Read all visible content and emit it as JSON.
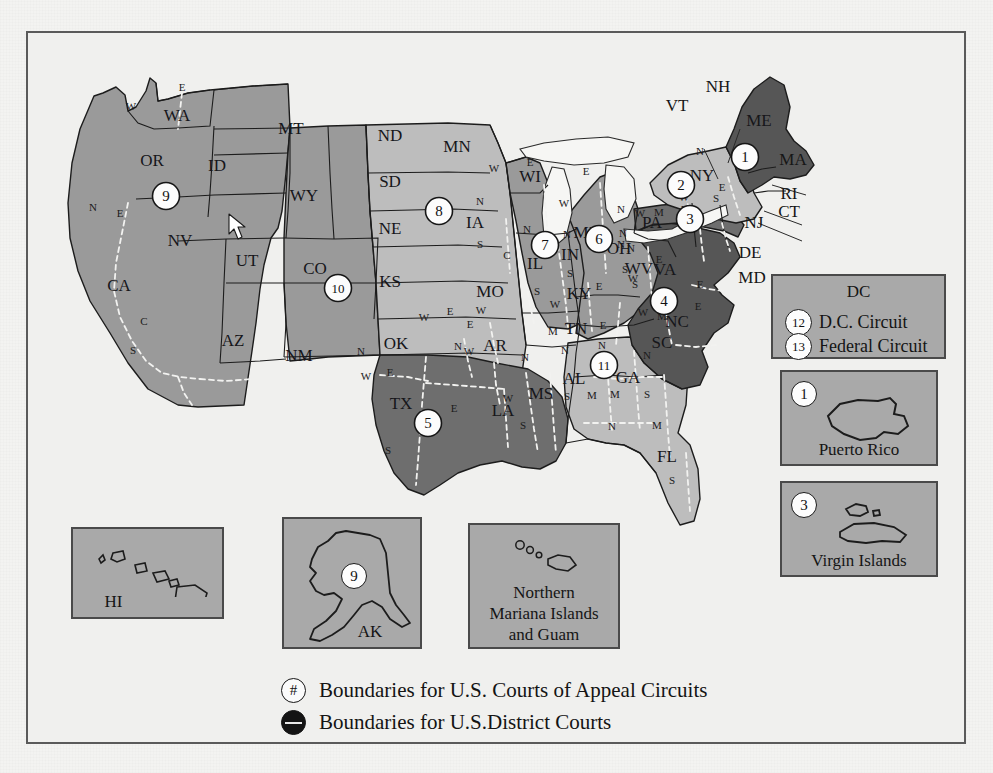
{
  "colors": {
    "page_bg": "#f3f3f1",
    "frame_border": "#5a5a5a",
    "circuit_light": "#bfbfbf",
    "circuit_mid": "#9a9a9a",
    "circuit_dark": "#6e6e6e",
    "circuit_darker": "#565656",
    "water": "#f5f5f3",
    "inset_fill": "#a9a9a9",
    "outline": "#1c1c1c",
    "district_line": "#f0f0f0"
  },
  "states": [
    {
      "code": "WA",
      "x": 175,
      "y": 115
    },
    {
      "code": "OR",
      "x": 150,
      "y": 160
    },
    {
      "code": "CA",
      "x": 117,
      "y": 285
    },
    {
      "code": "NV",
      "x": 178,
      "y": 240
    },
    {
      "code": "ID",
      "x": 215,
      "y": 165
    },
    {
      "code": "UT",
      "x": 245,
      "y": 260
    },
    {
      "code": "AZ",
      "x": 231,
      "y": 340
    },
    {
      "code": "MT",
      "x": 289,
      "y": 128
    },
    {
      "code": "WY",
      "x": 302,
      "y": 195
    },
    {
      "code": "CO",
      "x": 313,
      "y": 268
    },
    {
      "code": "NM",
      "x": 297,
      "y": 355
    },
    {
      "code": "ND",
      "x": 388,
      "y": 135
    },
    {
      "code": "SD",
      "x": 388,
      "y": 181
    },
    {
      "code": "NE",
      "x": 388,
      "y": 228
    },
    {
      "code": "KS",
      "x": 388,
      "y": 281
    },
    {
      "code": "OK",
      "x": 394,
      "y": 343
    },
    {
      "code": "TX",
      "x": 399,
      "y": 403
    },
    {
      "code": "MN",
      "x": 455,
      "y": 146
    },
    {
      "code": "IA",
      "x": 473,
      "y": 222
    },
    {
      "code": "MO",
      "x": 488,
      "y": 291
    },
    {
      "code": "AR",
      "x": 493,
      "y": 345
    },
    {
      "code": "LA",
      "x": 501,
      "y": 410
    },
    {
      "code": "WI",
      "x": 528,
      "y": 176
    },
    {
      "code": "IL",
      "x": 533,
      "y": 263
    },
    {
      "code": "MS",
      "x": 539,
      "y": 393
    },
    {
      "code": "MI",
      "x": 582,
      "y": 232
    },
    {
      "code": "IN",
      "x": 568,
      "y": 254
    },
    {
      "code": "KY",
      "x": 577,
      "y": 293
    },
    {
      "code": "TN",
      "x": 574,
      "y": 328
    },
    {
      "code": "AL",
      "x": 572,
      "y": 378
    },
    {
      "code": "OH",
      "x": 617,
      "y": 248
    },
    {
      "code": "GA",
      "x": 626,
      "y": 377
    },
    {
      "code": "FL",
      "x": 665,
      "y": 456
    },
    {
      "code": "SC",
      "x": 660,
      "y": 342
    },
    {
      "code": "NC",
      "x": 675,
      "y": 321
    },
    {
      "code": "VA",
      "x": 663,
      "y": 269
    },
    {
      "code": "WV",
      "x": 637,
      "y": 268
    },
    {
      "code": "PA",
      "x": 650,
      "y": 222
    },
    {
      "code": "NY",
      "x": 700,
      "y": 175
    },
    {
      "code": "ME",
      "x": 757,
      "y": 120
    }
  ],
  "leader_labels": [
    {
      "code": "NH",
      "x": 716,
      "y": 86
    },
    {
      "code": "VT",
      "x": 675,
      "y": 105
    },
    {
      "code": "MA",
      "x": 791,
      "y": 159
    },
    {
      "code": "RI",
      "x": 787,
      "y": 193
    },
    {
      "code": "CT",
      "x": 787,
      "y": 211
    },
    {
      "code": "NJ",
      "x": 752,
      "y": 222
    },
    {
      "code": "DE",
      "x": 748,
      "y": 252
    },
    {
      "code": "MD",
      "x": 750,
      "y": 277
    }
  ],
  "district_letters": [
    {
      "t": "W",
      "x": 129,
      "y": 105
    },
    {
      "t": "E",
      "x": 180,
      "y": 86
    },
    {
      "t": "N",
      "x": 91,
      "y": 206
    },
    {
      "t": "E",
      "x": 118,
      "y": 212
    },
    {
      "t": "C",
      "x": 142,
      "y": 320
    },
    {
      "t": "S",
      "x": 131,
      "y": 349
    },
    {
      "t": "N",
      "x": 359,
      "y": 350
    },
    {
      "t": "E",
      "x": 388,
      "y": 371
    },
    {
      "t": "W",
      "x": 364,
      "y": 375
    },
    {
      "t": "S",
      "x": 386,
      "y": 449
    },
    {
      "t": "E",
      "x": 452,
      "y": 407
    },
    {
      "t": "W",
      "x": 506,
      "y": 397
    },
    {
      "t": "N",
      "x": 523,
      "y": 356
    },
    {
      "t": "S",
      "x": 521,
      "y": 424
    },
    {
      "t": "W",
      "x": 422,
      "y": 316
    },
    {
      "t": "E",
      "x": 448,
      "y": 310
    },
    {
      "t": "N",
      "x": 456,
      "y": 345
    },
    {
      "t": "W",
      "x": 467,
      "y": 350
    },
    {
      "t": "E",
      "x": 468,
      "y": 323
    },
    {
      "t": "W",
      "x": 479,
      "y": 309
    },
    {
      "t": "N",
      "x": 478,
      "y": 200
    },
    {
      "t": "S",
      "x": 478,
      "y": 243
    },
    {
      "t": "C",
      "x": 505,
      "y": 254
    },
    {
      "t": "W",
      "x": 492,
      "y": 167
    },
    {
      "t": "E",
      "x": 528,
      "y": 161
    },
    {
      "t": "N",
      "x": 525,
      "y": 228
    },
    {
      "t": "S",
      "x": 535,
      "y": 290
    },
    {
      "t": "W",
      "x": 562,
      "y": 202
    },
    {
      "t": "E",
      "x": 584,
      "y": 170
    },
    {
      "t": "N",
      "x": 565,
      "y": 233
    },
    {
      "t": "S",
      "x": 568,
      "y": 272
    },
    {
      "t": "E",
      "x": 597,
      "y": 285
    },
    {
      "t": "W",
      "x": 553,
      "y": 303
    },
    {
      "t": "M",
      "x": 551,
      "y": 330
    },
    {
      "t": "E",
      "x": 601,
      "y": 324
    },
    {
      "t": "N",
      "x": 600,
      "y": 344
    },
    {
      "t": "N",
      "x": 563,
      "y": 349
    },
    {
      "t": "S",
      "x": 565,
      "y": 395
    },
    {
      "t": "M",
      "x": 590,
      "y": 394
    },
    {
      "t": "M",
      "x": 613,
      "y": 393
    },
    {
      "t": "N",
      "x": 645,
      "y": 354
    },
    {
      "t": "S",
      "x": 645,
      "y": 393
    },
    {
      "t": "N",
      "x": 610,
      "y": 425
    },
    {
      "t": "M",
      "x": 655,
      "y": 424
    },
    {
      "t": "S",
      "x": 670,
      "y": 479
    },
    {
      "t": "N",
      "x": 621,
      "y": 232
    },
    {
      "t": "S",
      "x": 623,
      "y": 268
    },
    {
      "t": "N",
      "x": 619,
      "y": 243
    },
    {
      "t": "N",
      "x": 629,
      "y": 247
    },
    {
      "t": "S",
      "x": 633,
      "y": 283
    },
    {
      "t": "W",
      "x": 631,
      "y": 277
    },
    {
      "t": "E",
      "x": 657,
      "y": 258
    },
    {
      "t": "W",
      "x": 641,
      "y": 311
    },
    {
      "t": "M",
      "x": 660,
      "y": 315
    },
    {
      "t": "E",
      "x": 696,
      "y": 305
    },
    {
      "t": "E",
      "x": 698,
      "y": 283
    },
    {
      "t": "M",
      "x": 657,
      "y": 211
    },
    {
      "t": "E",
      "x": 682,
      "y": 208
    },
    {
      "t": "W",
      "x": 638,
      "y": 212
    },
    {
      "t": "N",
      "x": 619,
      "y": 208
    },
    {
      "t": "N",
      "x": 698,
      "y": 150
    },
    {
      "t": "W",
      "x": 682,
      "y": 196
    },
    {
      "t": "S",
      "x": 714,
      "y": 197
    },
    {
      "t": "E",
      "x": 720,
      "y": 186
    }
  ],
  "circuit_badges": [
    {
      "num": "9",
      "x": 164,
      "y": 194
    },
    {
      "num": "10",
      "x": 336,
      "y": 286
    },
    {
      "num": "8",
      "x": 437,
      "y": 209
    },
    {
      "num": "7",
      "x": 543,
      "y": 243
    },
    {
      "num": "6",
      "x": 597,
      "y": 237
    },
    {
      "num": "5",
      "x": 426,
      "y": 421
    },
    {
      "num": "11",
      "x": 602,
      "y": 363
    },
    {
      "num": "4",
      "x": 662,
      "y": 299
    },
    {
      "num": "3",
      "x": 688,
      "y": 217
    },
    {
      "num": "2",
      "x": 679,
      "y": 183
    },
    {
      "num": "1",
      "x": 743,
      "y": 155
    }
  ],
  "dc_box": {
    "title": "DC",
    "rows": [
      {
        "num": "12",
        "label": "D.C. Circuit"
      },
      {
        "num": "13",
        "label": "Federal  Circuit"
      }
    ]
  },
  "insets": [
    {
      "id": "puerto-rico",
      "num": "1",
      "label": "Puerto Rico"
    },
    {
      "id": "virgin-islands",
      "num": "3",
      "label": "Virgin Islands"
    },
    {
      "id": "hawaii",
      "num": "",
      "label": "HI"
    },
    {
      "id": "alaska",
      "num": "9",
      "label": "AK"
    },
    {
      "id": "mariana-guam",
      "num": "",
      "label": "Northern\nMariana Islands\nand Guam"
    }
  ],
  "inset_hawaii_label": "HI",
  "inset_alaska_label": "AK",
  "inset_alaska_num": "9",
  "inset_mariana_line1": "Northern",
  "inset_mariana_line2": "Mariana Islands",
  "inset_mariana_line3": "and Guam",
  "inset_pr_label": "Puerto Rico",
  "inset_pr_num": "1",
  "inset_vi_label": "Virgin Islands",
  "inset_vi_num": "3",
  "legend": {
    "rows": [
      {
        "symbol": "#",
        "text": "Boundaries for U.S. Courts of Appeal Circuits",
        "type": "open"
      },
      {
        "symbol": "",
        "text": "Boundaries for U.S.District Courts",
        "type": "filled"
      }
    ],
    "row0_sym": "#",
    "row0_text": "Boundaries for U.S. Courts of Appeal Circuits",
    "row1_text": "Boundaries for U.S.District Courts"
  }
}
